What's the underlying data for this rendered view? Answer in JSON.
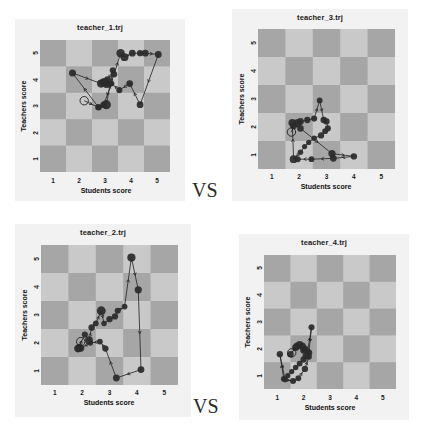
{
  "figure": {
    "width": 422,
    "height": 435,
    "background": "#ffffff",
    "panel_background": "#f2f2f2",
    "board_light": "#c9c9c9",
    "board_dark": "#a6a6a6",
    "marker_color": "#2a2a2a",
    "line_color": "#1f1f1f"
  },
  "comparisons": [
    {
      "label": "VS",
      "name": "vs-top"
    },
    {
      "label": "VS",
      "name": "vs-bottom"
    }
  ],
  "axes": {
    "xlabel": "Students score",
    "ylabel": "Teachers score",
    "xticks": [
      "1",
      "2",
      "3",
      "4",
      "5"
    ],
    "yticks": [
      "1",
      "2",
      "3",
      "4",
      "5"
    ],
    "xlim": [
      0.5,
      5.5
    ],
    "ylim": [
      0.5,
      5.5
    ],
    "grid": "checkerboard"
  },
  "chart_data": [
    {
      "type": "scatter",
      "name": "teacher_1",
      "title": "teacher_1.trj",
      "xlabel": "Students score",
      "ylabel": "Teachers score",
      "xlim": [
        0.5,
        5.5
      ],
      "ylim": [
        0.5,
        5.5
      ],
      "xticks": [
        1,
        2,
        3,
        4,
        5
      ],
      "yticks": [
        1,
        2,
        3,
        4,
        5
      ],
      "grid": "checkerboard",
      "start_marker": {
        "x": 2.2,
        "y": 3.2,
        "style": "open-circle"
      },
      "x": [
        2.2,
        2.75,
        3.05,
        3.3,
        3.05,
        2.95,
        3.1,
        3.2,
        3.35,
        3.6,
        3.75,
        4.05,
        4.35,
        4.55,
        5.05,
        4.35,
        3.95,
        3.55,
        3.25,
        2.95,
        2.75,
        1.75,
        2.85,
        3.0
      ],
      "y": [
        3.2,
        2.95,
        3.05,
        4.35,
        3.85,
        3.9,
        4.0,
        3.85,
        4.2,
        5.0,
        4.85,
        5.0,
        5.0,
        5.0,
        4.95,
        3.05,
        3.85,
        3.6,
        3.85,
        3.05,
        2.95,
        4.25,
        3.85,
        3.9
      ],
      "sizes": [
        0,
        28,
        55,
        25,
        50,
        42,
        30,
        22,
        26,
        46,
        40,
        30,
        26,
        30,
        30,
        30,
        30,
        24,
        22,
        26,
        18,
        32,
        44,
        40
      ]
    },
    {
      "type": "scatter",
      "name": "teacher_2",
      "title": "teacher_2.trj",
      "xlabel": "Students score",
      "ylabel": "Teachers score",
      "xlim": [
        0.5,
        5.5
      ],
      "ylim": [
        0.5,
        5.5
      ],
      "xticks": [
        1,
        2,
        3,
        4,
        5
      ],
      "yticks": [
        1,
        2,
        3,
        4,
        5
      ],
      "grid": "checkerboard",
      "start_marker": {
        "x": 1.95,
        "y": 2.05,
        "style": "open-circle"
      },
      "x": [
        1.95,
        1.9,
        1.85,
        2.1,
        2.25,
        2.35,
        2.5,
        2.7,
        2.8,
        3.0,
        3.2,
        3.3,
        3.55,
        3.8,
        4.05,
        4.15,
        3.25,
        2.85,
        2.65,
        2.3,
        1.95,
        1.88
      ],
      "y": [
        2.05,
        1.85,
        1.8,
        2.3,
        2.1,
        2.55,
        2.7,
        3.15,
        2.7,
        2.85,
        2.95,
        3.15,
        3.3,
        5.05,
        3.9,
        1.05,
        0.75,
        1.8,
        2.05,
        2.0,
        1.82,
        1.8
      ],
      "sizes": [
        0,
        30,
        38,
        24,
        40,
        28,
        22,
        52,
        20,
        26,
        26,
        24,
        22,
        44,
        34,
        30,
        30,
        26,
        22,
        20,
        34,
        30
      ]
    },
    {
      "type": "scatter",
      "name": "teacher_3",
      "title": "teacher_3.trj",
      "xlabel": "Students score",
      "ylabel": "Teachers score",
      "xlim": [
        0.5,
        5.5
      ],
      "ylim": [
        0.5,
        5.5
      ],
      "xticks": [
        1,
        2,
        3,
        4,
        5
      ],
      "yticks": [
        1,
        2,
        3,
        4,
        5
      ],
      "grid": "checkerboard",
      "start_marker": {
        "x": 1.72,
        "y": 1.82,
        "style": "open-circle"
      },
      "x": [
        1.72,
        1.8,
        1.95,
        2.05,
        2.3,
        2.55,
        2.75,
        2.9,
        3.0,
        3.05,
        2.95,
        2.8,
        2.55,
        2.35,
        2.2,
        2.05,
        1.8,
        1.75,
        2.05,
        3.2,
        4.0,
        3.25,
        2.45,
        1.95
      ],
      "y": [
        1.82,
        2.05,
        2.15,
        2.2,
        2.25,
        2.3,
        2.95,
        2.25,
        2.2,
        1.95,
        1.85,
        1.7,
        1.6,
        1.45,
        1.3,
        1.1,
        0.85,
        2.15,
        1.95,
        1.05,
        0.95,
        0.88,
        0.85,
        0.85
      ],
      "sizes": [
        0,
        34,
        40,
        30,
        26,
        24,
        22,
        28,
        26,
        24,
        22,
        26,
        20,
        18,
        18,
        20,
        40,
        38,
        28,
        34,
        26,
        30,
        22,
        24
      ]
    },
    {
      "type": "scatter",
      "name": "teacher_4",
      "title": "teacher_4.trj",
      "xlabel": "Students score",
      "ylabel": "Teachers score",
      "xlim": [
        0.5,
        5.5
      ],
      "ylim": [
        0.5,
        5.5
      ],
      "xticks": [
        1,
        2,
        3,
        4,
        5
      ],
      "yticks": [
        1,
        2,
        3,
        4,
        5
      ],
      "grid": "checkerboard",
      "start_marker": {
        "x": 1.55,
        "y": 1.85,
        "style": "open-circle"
      },
      "x": [
        1.55,
        1.7,
        1.85,
        1.95,
        2.05,
        2.15,
        2.3,
        2.2,
        2.1,
        2.0,
        1.85,
        1.7,
        1.55,
        1.4,
        1.25,
        1.1,
        1.3,
        1.6,
        1.8,
        2.05,
        2.2,
        2.0,
        1.75,
        1.5
      ],
      "y": [
        1.85,
        2.05,
        2.15,
        2.1,
        2.0,
        1.9,
        2.8,
        1.85,
        1.75,
        1.6,
        1.45,
        1.3,
        1.15,
        1.0,
        0.88,
        1.8,
        0.85,
        0.8,
        0.9,
        1.25,
        1.7,
        1.95,
        2.1,
        1.8
      ],
      "sizes": [
        0,
        32,
        38,
        34,
        30,
        26,
        24,
        30,
        34,
        26,
        22,
        20,
        18,
        18,
        22,
        26,
        20,
        24,
        22,
        26,
        24,
        30,
        34,
        28
      ]
    }
  ]
}
